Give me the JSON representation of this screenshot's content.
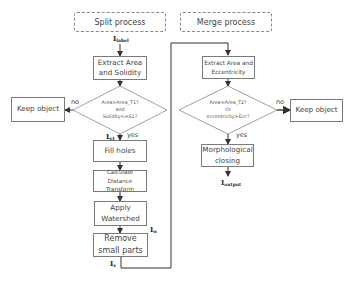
{
  "split": {
    "header": "Split process",
    "input_label": "I",
    "input_sub": "label",
    "extract": "Extract Area\nand Solidity",
    "condition": "Area>Area_T1?\nand\nSolidity<=S1?",
    "no_label": "no",
    "yes_label": "yes",
    "keep": "Keep object",
    "s1_label": "I",
    "s1_sub": "s1",
    "fill": "Fill holes",
    "distance": "Calculate\nDistance\nTransform",
    "watershed": "Apply\nWatershed",
    "w_label": "I",
    "w_sub": "w",
    "remove": "Remove\nsmall parts",
    "s_label": "I",
    "s_sub": "s"
  },
  "merge": {
    "header": "Merge process",
    "extract": "Extract Area and\nEccentricity",
    "condition": "Area<Area_T2?\nOr\neccentricity>Ecc?",
    "no_label": "no",
    "yes_label": "yes",
    "keep": "Keep object",
    "closing": "Morphological\nclosing",
    "output_label": "I",
    "output_sub": "output"
  },
  "colors": {
    "line": "#333333",
    "border": "#7a7a7a",
    "dashed": "#888888"
  }
}
